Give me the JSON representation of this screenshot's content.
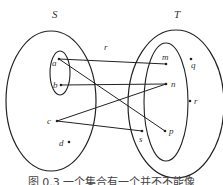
{
  "diagram": {
    "set_S_label": "S",
    "set_T_label": "T",
    "relation_label": "r",
    "domain_elements": [
      "a",
      "b",
      "c",
      "d"
    ],
    "codomain_elements": [
      "m",
      "n",
      "p",
      "s",
      "q",
      "r"
    ],
    "labels": {
      "a": "a",
      "b": "b",
      "c": "c",
      "d": "d",
      "m": "m",
      "n": "n",
      "p": "p",
      "s": "s",
      "q": "q",
      "r": "r"
    },
    "mappings": [
      {
        "from": "a",
        "to": "m"
      },
      {
        "from": "a",
        "to": "p"
      },
      {
        "from": "b",
        "to": "n"
      },
      {
        "from": "c",
        "to": "n"
      },
      {
        "from": "c",
        "to": "s"
      }
    ],
    "caption": "图 0.3    一个集合有一个并不不能像"
  }
}
